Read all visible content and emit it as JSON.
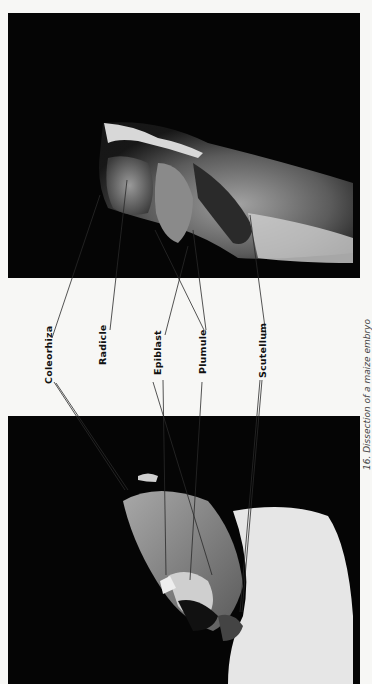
{
  "figure": {
    "caption": "16. Dissection of a maize embryo",
    "photos": [
      {
        "id": "top",
        "description": "Longitudinal view of embryo, radicle and coleorhiza region"
      },
      {
        "id": "bottom",
        "description": "Dissected embryo showing plumule and scutellum"
      }
    ],
    "labels": [
      {
        "key": "coleorhiza",
        "text": "Coleorhiza"
      },
      {
        "key": "radicle",
        "text": "Radicle"
      },
      {
        "key": "epiblast",
        "text": "Epiblast"
      },
      {
        "key": "plumule",
        "text": "Plumule"
      },
      {
        "key": "scutellum",
        "text": "Scutellum"
      }
    ],
    "colors": {
      "background": "#f7f7f5",
      "photo_bg": "#050505",
      "label_text": "#111111",
      "leader_line": "#2a2a2a"
    }
  }
}
